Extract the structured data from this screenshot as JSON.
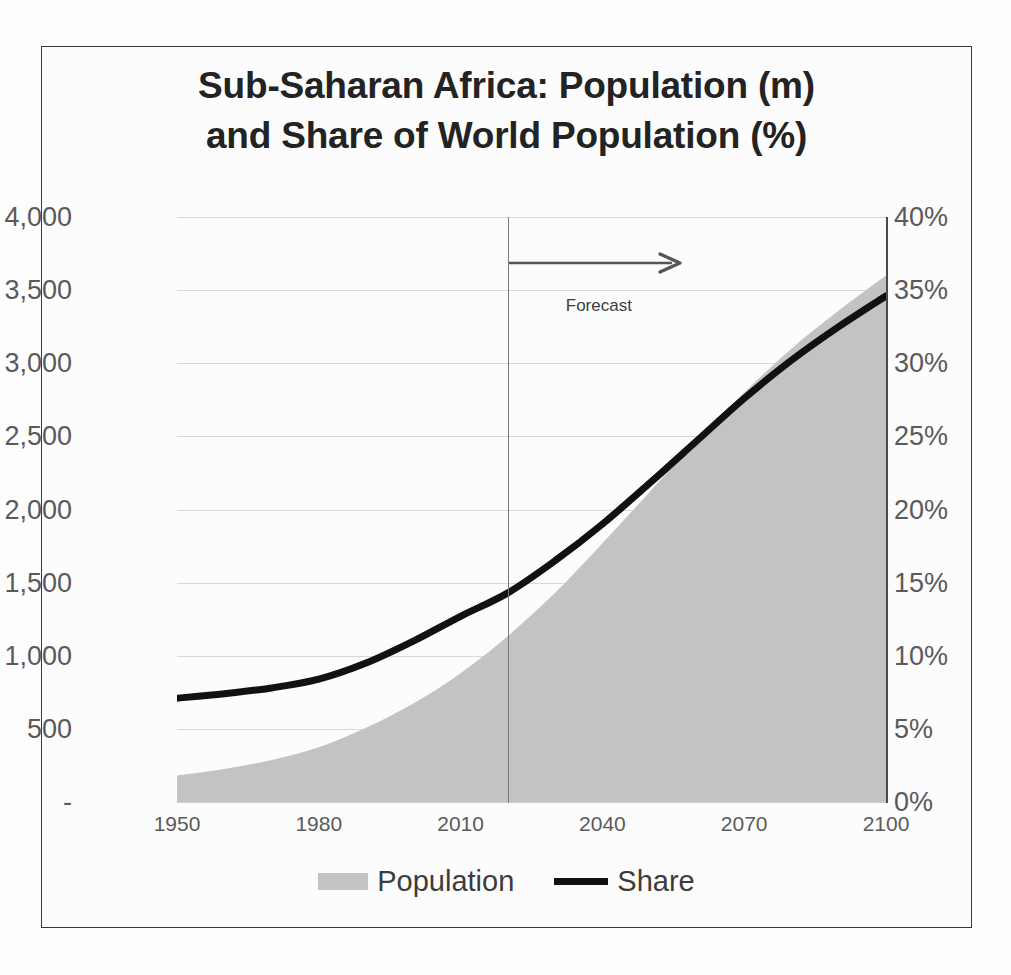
{
  "chart_data": {
    "type": "area",
    "title": "Sub-Saharan Africa: Population (m) and Share of World Population (%)",
    "title_line1": "Sub-Saharan Africa: Population (m)",
    "title_line2": "and Share of World Population (%)",
    "xlabel": "",
    "ylabel": "",
    "xlim": [
      1950,
      2100
    ],
    "x_ticks": [
      "1950",
      "1980",
      "2010",
      "2040",
      "2070",
      "2100"
    ],
    "x_tick_values": [
      1950,
      1980,
      2010,
      2040,
      2070,
      2100
    ],
    "left_axis": {
      "label": "Population (m)",
      "ylim": [
        0,
        4000
      ],
      "ticks": [
        "4,000",
        "3,500",
        "3,000",
        "2,500",
        "2,000",
        "1,500",
        "1,000",
        "500",
        "-"
      ],
      "tick_values": [
        4000,
        3500,
        3000,
        2500,
        2000,
        1500,
        1000,
        500,
        0
      ]
    },
    "right_axis": {
      "label": "Share of World Population (%)",
      "ylim": [
        0,
        40
      ],
      "ticks": [
        "40%",
        "35%",
        "30%",
        "25%",
        "20%",
        "15%",
        "10%",
        "5%",
        "0%"
      ],
      "tick_values": [
        40,
        35,
        30,
        25,
        20,
        15,
        10,
        5,
        0
      ]
    },
    "grid": true,
    "legend_position": "bottom",
    "annotations": [
      {
        "text": "Forecast",
        "x_start": 2020,
        "x_end": 2058,
        "kind": "arrow-right"
      }
    ],
    "forecast_divider_x": 2020,
    "x": [
      1950,
      1960,
      1970,
      1980,
      1990,
      2000,
      2010,
      2020,
      2030,
      2040,
      2050,
      2060,
      2070,
      2080,
      2090,
      2100
    ],
    "series": [
      {
        "name": "Population",
        "axis": "left",
        "unit": "millions",
        "type": "area",
        "color": "#c3c3c3",
        "values": [
          180,
          225,
          287,
          374,
          507,
          673,
          880,
          1135,
          1430,
          1770,
          2120,
          2470,
          2800,
          3100,
          3360,
          3600
        ]
      },
      {
        "name": "Share",
        "axis": "right",
        "unit": "percent",
        "type": "line",
        "color": "#111111",
        "values": [
          7.1,
          7.4,
          7.8,
          8.4,
          9.5,
          11.0,
          12.7,
          14.3,
          16.5,
          19.0,
          21.8,
          24.7,
          27.6,
          30.2,
          32.5,
          34.6
        ]
      }
    ]
  },
  "legend": {
    "items": [
      {
        "label": "Population",
        "marker": "area-swatch"
      },
      {
        "label": "Share",
        "marker": "line-swatch"
      }
    ]
  }
}
